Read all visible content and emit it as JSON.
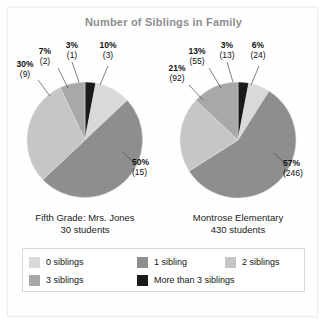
{
  "chart_data": {
    "type": "pie",
    "title": "Number of Siblings in Family",
    "legend_position": "bottom",
    "categories": [
      "0 siblings",
      "1 sibling",
      "2 siblings",
      "3 siblings",
      "More than 3 siblings"
    ],
    "colors": [
      "#d9d9d9",
      "#8e8e8e",
      "#c6c6c6",
      "#a8a8a8",
      "#1a1a1a"
    ],
    "charts": [
      {
        "name": "Fifth Grade: Mrs. Jones",
        "caption_line1": "Fifth Grade: Mrs. Jones",
        "caption_line2": "30 students",
        "total": 30,
        "slices": [
          {
            "category": "0 siblings",
            "percent": 10,
            "count": 3,
            "pct_label": "10%",
            "count_label": "(3)"
          },
          {
            "category": "1 sibling",
            "percent": 50,
            "count": 15,
            "pct_label": "50%",
            "count_label": "(15)"
          },
          {
            "category": "2 siblings",
            "percent": 30,
            "count": 9,
            "pct_label": "30%",
            "count_label": "(9)"
          },
          {
            "category": "3 siblings",
            "percent": 7,
            "count": 2,
            "pct_label": "7%",
            "count_label": "(2)"
          },
          {
            "category": "More than 3 siblings",
            "percent": 3,
            "count": 1,
            "pct_label": "3%",
            "count_label": "(1)"
          }
        ]
      },
      {
        "name": "Montrose Elementary",
        "caption_line1": "Montrose Elementary",
        "caption_line2": "430 students",
        "total": 430,
        "slices": [
          {
            "category": "0 siblings",
            "percent": 6,
            "count": 24,
            "pct_label": "6%",
            "count_label": "(24)"
          },
          {
            "category": "1 sibling",
            "percent": 57,
            "count": 246,
            "pct_label": "57%",
            "count_label": "(246)"
          },
          {
            "category": "2 siblings",
            "percent": 21,
            "count": 92,
            "pct_label": "21%",
            "count_label": "(92)"
          },
          {
            "category": "3 siblings",
            "percent": 13,
            "count": 55,
            "pct_label": "13%",
            "count_label": "(55)"
          },
          {
            "category": "More than 3 siblings",
            "percent": 3,
            "count": 13,
            "pct_label": "3%",
            "count_label": "(13)"
          }
        ]
      }
    ]
  },
  "title": "Number of Siblings in Family",
  "legend": {
    "row1": [
      {
        "label": "0 siblings",
        "color": "#d9d9d9"
      },
      {
        "label": "1 sibling",
        "color": "#8e8e8e"
      },
      {
        "label": "2 siblings",
        "color": "#c6c6c6"
      }
    ],
    "row2": [
      {
        "label": "3 siblings",
        "color": "#a8a8a8"
      },
      {
        "label": "More than 3 siblings",
        "color": "#1a1a1a"
      }
    ]
  },
  "left": {
    "caption1": "Fifth Grade: Mrs. Jones",
    "caption2": "30 students",
    "labels": {
      "zero_pct": "10%",
      "zero_cnt": "(3)",
      "one_pct": "50%",
      "one_cnt": "(15)",
      "two_pct": "30%",
      "two_cnt": "(9)",
      "three_pct": "7%",
      "three_cnt": "(2)",
      "more_pct": "3%",
      "more_cnt": "(1)"
    }
  },
  "right": {
    "caption1": "Montrose Elementary",
    "caption2": "430 students",
    "labels": {
      "zero_pct": "6%",
      "zero_cnt": "(24)",
      "one_pct": "57%",
      "one_cnt": "(246)",
      "two_pct": "21%",
      "two_cnt": "(92)",
      "three_pct": "13%",
      "three_cnt": "(55)",
      "more_pct": "3%",
      "more_cnt": "(13)"
    }
  }
}
